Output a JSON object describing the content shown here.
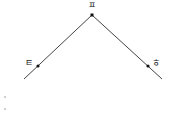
{
  "diagram": {
    "points": [
      {
        "id": "apex",
        "label": "ㅍ",
        "x": 92,
        "y": 15
      },
      {
        "id": "left",
        "label": "ㅌ",
        "x": 38,
        "y": 66
      },
      {
        "id": "right",
        "label": "ㅎ",
        "x": 148,
        "y": 66
      }
    ],
    "lines": [
      {
        "from": [
          92,
          15
        ],
        "to": [
          24,
          79
        ]
      },
      {
        "from": [
          92,
          15
        ],
        "to": [
          162,
          79
        ]
      }
    ],
    "colors": {
      "line": "#444444",
      "point": "#111111",
      "text": "#222222"
    }
  }
}
